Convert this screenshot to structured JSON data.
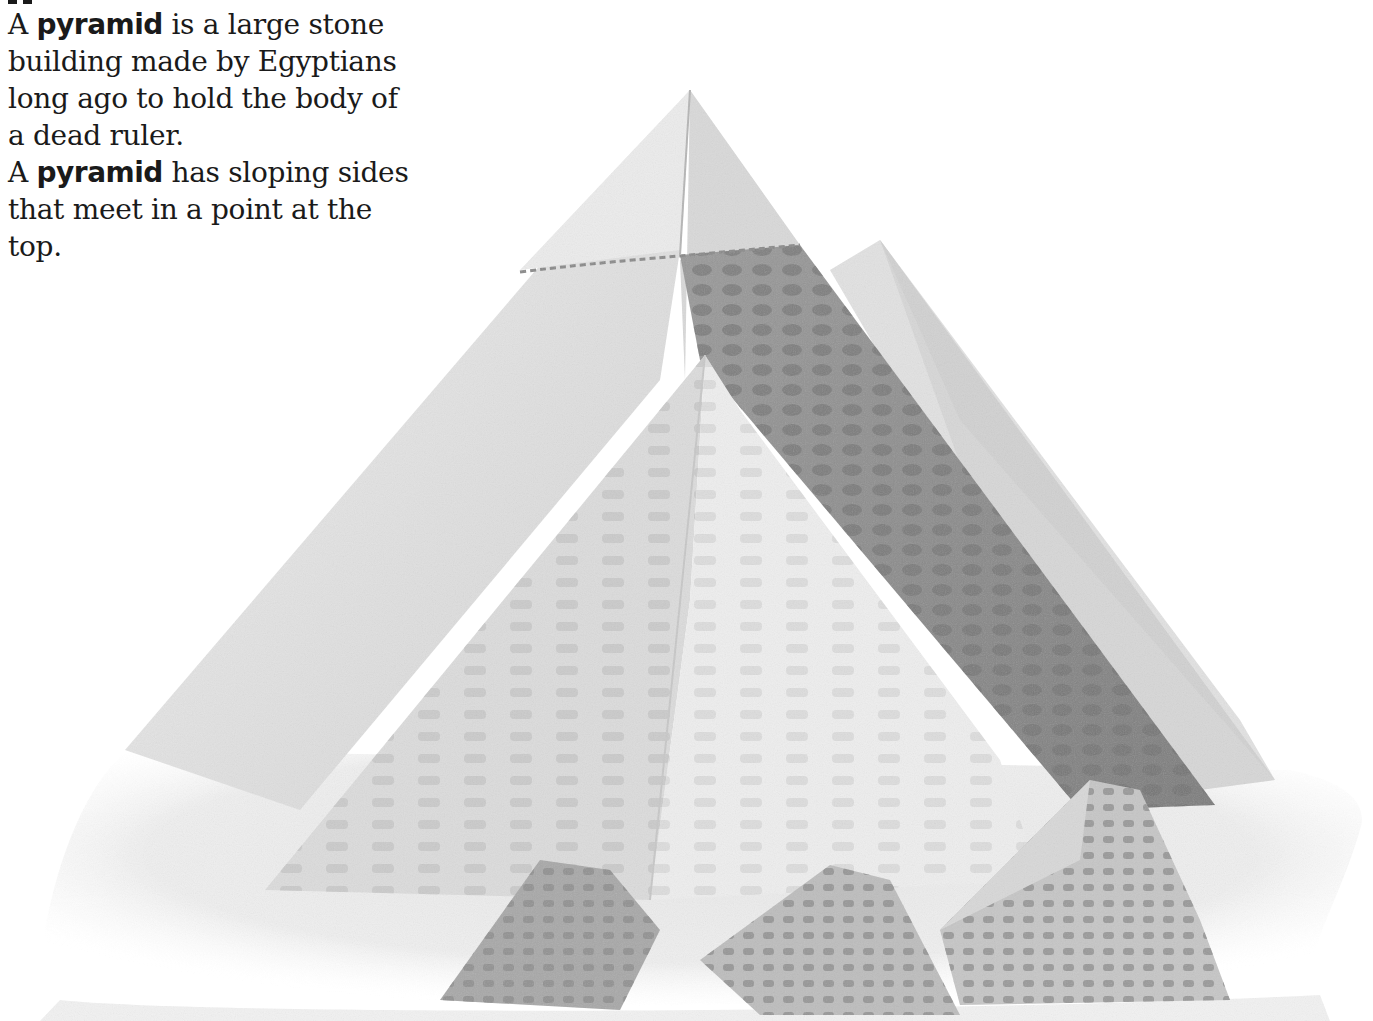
{
  "entry": {
    "headword": "pyramid",
    "sentences": [
      {
        "prefix": "A ",
        "keyword": "pyramid",
        "suffix": " is a large stone building made by Egyptians long ago to hold the body of a dead ruler."
      },
      {
        "prefix": "A ",
        "keyword": "pyramid",
        "suffix": " has sloping sides that meet in a point at the top."
      }
    ]
  },
  "illustration": {
    "subject": "Pyramids of Giza pencil drawing",
    "elements": [
      "great-pyramid",
      "second-pyramid",
      "third-pyramid-background",
      "small-queens-pyramids",
      "sand-ground"
    ],
    "palette": {
      "paper": "#ffffff",
      "light_face": "#e6e6e6",
      "mid_face": "#cfcfcf",
      "dark_face": "#8e8e8e",
      "stone_blocks": "#a9a9a9",
      "sand": "#ececec"
    }
  }
}
